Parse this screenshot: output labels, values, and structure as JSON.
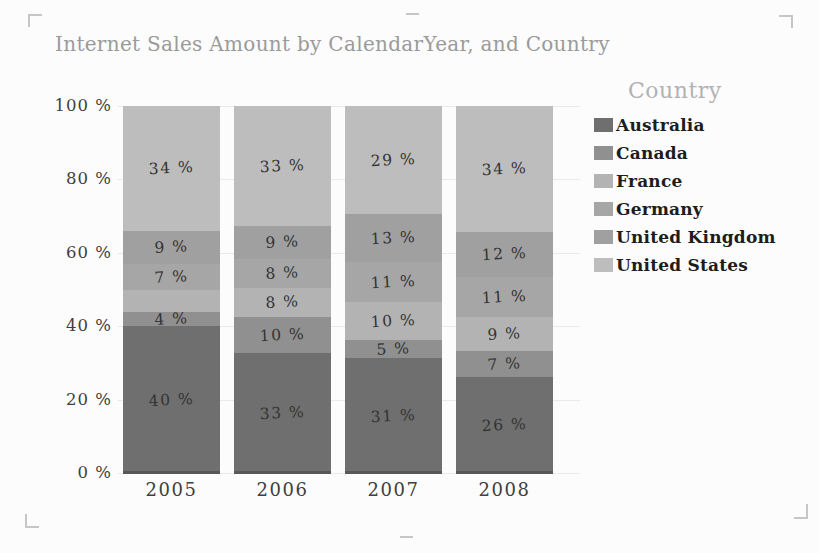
{
  "title": "Internet Sales Amount by CalendarYear, and Country",
  "legend": {
    "title": "Country",
    "items": [
      {
        "label": "Australia",
        "color": "#6f6f6f"
      },
      {
        "label": "Canada",
        "color": "#909090"
      },
      {
        "label": "France",
        "color": "#b3b3b3"
      },
      {
        "label": "Germany",
        "color": "#a6a6a6"
      },
      {
        "label": "United Kingdom",
        "color": "#a0a0a0"
      },
      {
        "label": "United States",
        "color": "#bdbdbd"
      }
    ]
  },
  "chart_data": {
    "type": "bar",
    "variant": "100-percent-stacked-column",
    "title": "Internet Sales Amount by CalendarYear, and Country",
    "categories": [
      "2005",
      "2006",
      "2007",
      "2008"
    ],
    "series": [
      {
        "name": "Australia",
        "color": "#6f6f6f",
        "values": [
          40,
          33,
          31,
          26
        ],
        "labels": [
          "40 %",
          "33 %",
          "31 %",
          "26 %"
        ]
      },
      {
        "name": "Canada",
        "color": "#909090",
        "values": [
          4,
          10,
          5,
          7
        ],
        "labels": [
          "4 %",
          "10 %",
          "5 %",
          "7 %"
        ]
      },
      {
        "name": "France",
        "color": "#b3b3b3",
        "values": [
          6,
          8,
          10,
          9
        ],
        "labels": [
          "",
          "8 %",
          "10 %",
          "9 %"
        ]
      },
      {
        "name": "Germany",
        "color": "#a6a6a6",
        "values": [
          7,
          8,
          11,
          11
        ],
        "labels": [
          "7 %",
          "8 %",
          "11 %",
          "11 %"
        ]
      },
      {
        "name": "United Kingdom",
        "color": "#a0a0a0",
        "values": [
          9,
          9,
          13,
          12
        ],
        "labels": [
          "9 %",
          "9 %",
          "13 %",
          "12 %"
        ]
      },
      {
        "name": "United States",
        "color": "#bdbdbd",
        "values": [
          34,
          33,
          29,
          34
        ],
        "labels": [
          "34 %",
          "33 %",
          "29 %",
          "34 %"
        ]
      }
    ],
    "stack_order_bottom_to_top": [
      "Australia",
      "Canada",
      "France",
      "Germany",
      "United Kingdom",
      "United States"
    ],
    "y_axis": {
      "range": [
        0,
        100
      ],
      "gridlines": true,
      "ticks": [
        {
          "label": "100 %",
          "value": 100
        },
        {
          "label": "80 %",
          "value": 80
        },
        {
          "label": "60 %",
          "value": 60
        },
        {
          "label": "40 %",
          "value": 40
        },
        {
          "label": "20 %",
          "value": 20
        },
        {
          "label": "0 %",
          "value": 0
        }
      ]
    },
    "xlabel": "",
    "ylabel": "",
    "legend_position": "right",
    "legend_title": "Country"
  },
  "colors": {
    "title_text": "#9a9a9a",
    "legend_title_text": "#b2b2b2",
    "legend_item_text": "#1d1d1d",
    "axis_text": "#3f3f3f",
    "bar_label_text": "#333333",
    "gridline": "#eaeaea",
    "bar_bottom_edge": "#585858",
    "crop_mark": "#c6c6c6",
    "background": "#fcfcfc"
  }
}
